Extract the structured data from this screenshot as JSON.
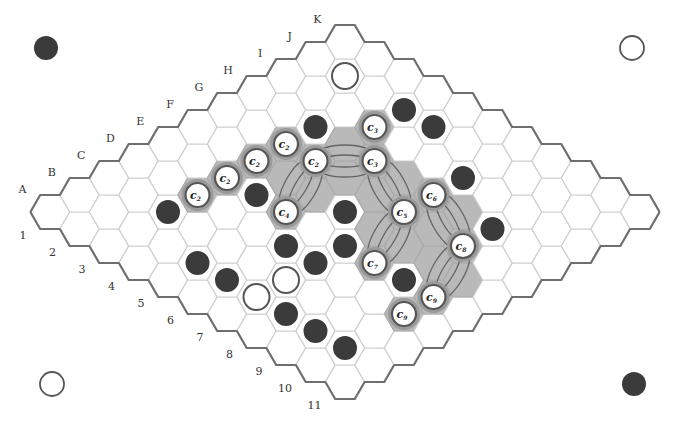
{
  "diagram": {
    "type": "hex-board",
    "size": 11,
    "column_labels": [
      "A",
      "B",
      "C",
      "D",
      "E",
      "F",
      "G",
      "H",
      "I",
      "J",
      "K"
    ],
    "row_labels": [
      "1",
      "2",
      "3",
      "4",
      "5",
      "6",
      "7",
      "8",
      "9",
      "10",
      "11"
    ],
    "colors": {
      "black_stone": "#3b3b3b",
      "white_stone": "#ffffff",
      "shaded_region": "#b9b9b9",
      "grid_line": "#cfcfcf",
      "edge_line": "#6e6e6e"
    },
    "corner_markers": [
      {
        "position": "top-left",
        "color": "black"
      },
      {
        "position": "top-right",
        "color": "white"
      },
      {
        "position": "bottom-left",
        "color": "white"
      },
      {
        "position": "bottom-right",
        "color": "black"
      }
    ],
    "black_stones": [
      "H3",
      "J4",
      "J5",
      "I7",
      "H9",
      "C3",
      "E4",
      "F6",
      "D6",
      "E7",
      "D7",
      "B5",
      "B6",
      "E9",
      "B8",
      "B9",
      "B10"
    ],
    "white_stones": [
      "J2",
      "C7",
      "B7"
    ],
    "labeled_white_stones": [
      {
        "cell": "D3",
        "label": "c",
        "sub": "2"
      },
      {
        "cell": "E3",
        "label": "c",
        "sub": "2"
      },
      {
        "cell": "F3",
        "label": "c",
        "sub": "2"
      },
      {
        "cell": "G3",
        "label": "c",
        "sub": "2"
      },
      {
        "cell": "G4",
        "label": "c",
        "sub": "2"
      },
      {
        "cell": "I4",
        "label": "c",
        "sub": "3"
      },
      {
        "cell": "H5",
        "label": "c",
        "sub": "3"
      },
      {
        "cell": "E5",
        "label": "c",
        "sub": "4"
      },
      {
        "cell": "G7",
        "label": "c",
        "sub": "5"
      },
      {
        "cell": "H7",
        "label": "c",
        "sub": "6"
      },
      {
        "cell": "E8",
        "label": "c",
        "sub": "7"
      },
      {
        "cell": "G9",
        "label": "c",
        "sub": "8"
      },
      {
        "cell": "E10",
        "label": "c",
        "sub": "9"
      },
      {
        "cell": "D10",
        "label": "c",
        "sub": "9"
      }
    ],
    "shaded_cells": [
      "D3",
      "E3",
      "F3",
      "G3",
      "G4",
      "I4",
      "H5",
      "E5",
      "G7",
      "H7",
      "E8",
      "G9",
      "E10",
      "D10",
      "H4",
      "F4",
      "F5",
      "G5",
      "G6",
      "H6",
      "F7",
      "F8",
      "G8",
      "H8",
      "F9",
      "F10"
    ],
    "bridges": [
      [
        "G4",
        "H5"
      ],
      [
        "G4",
        "E5"
      ],
      [
        "H5",
        "G7"
      ],
      [
        "G7",
        "E8"
      ],
      [
        "H7",
        "G9"
      ],
      [
        "G9",
        "E10"
      ]
    ]
  }
}
